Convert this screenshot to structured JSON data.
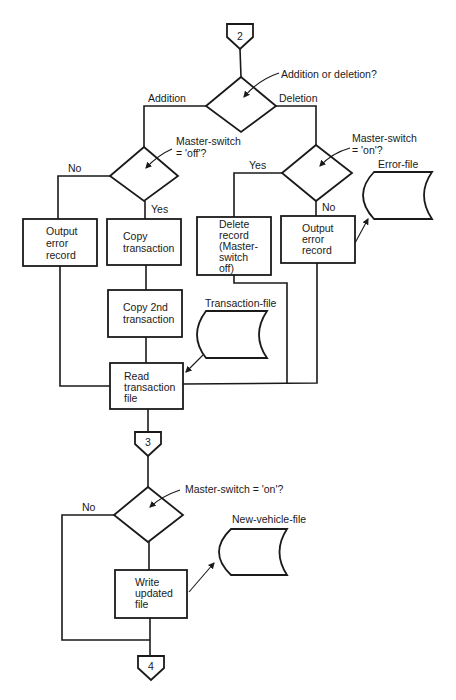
{
  "connectors": {
    "top": "2",
    "middle": "3",
    "bottom": "4"
  },
  "decisions": {
    "add_or_delete": "Addition or deletion?",
    "master_off": [
      "Master-switch",
      "= 'off'?"
    ],
    "master_on_del": [
      "Master-switch",
      "= 'on'?"
    ],
    "master_on_final": "Master-switch = 'on'?"
  },
  "branch_labels": {
    "addition": "Addition",
    "deletion": "Deletion",
    "no_left": "No",
    "yes_left": "Yes",
    "yes_right": "Yes",
    "no_right": "No",
    "no_final": "No"
  },
  "processes": {
    "output_error_left": [
      "Output",
      "error",
      "record"
    ],
    "copy_transaction": [
      "Copy",
      "transaction"
    ],
    "copy_2nd": [
      "Copy 2nd",
      "transaction"
    ],
    "delete_record": [
      "Delete",
      "record",
      "(Master-",
      "switch",
      "off)"
    ],
    "output_error_right": [
      "Output",
      "error",
      "record"
    ],
    "read_transaction": [
      "Read",
      "transaction",
      "file"
    ],
    "write_updated": [
      "Write",
      "updated",
      "file"
    ]
  },
  "files": {
    "error": "Error-file",
    "transaction": "Transaction-file",
    "new_vehicle": "New-vehicle-file"
  }
}
